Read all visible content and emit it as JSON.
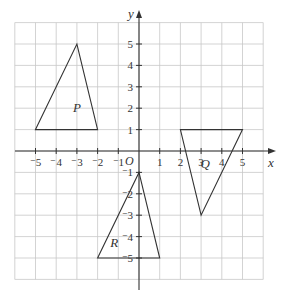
{
  "diagram": {
    "axes": {
      "x_label": "x",
      "y_label": "y",
      "origin_label": "O",
      "x_range": [
        -6,
        6
      ],
      "y_range": [
        -6,
        6
      ],
      "x_ticks": [
        "-5",
        "-4",
        "-3",
        "-2",
        "-1",
        "1",
        "2",
        "3",
        "4",
        "5"
      ],
      "y_ticks": [
        "5",
        "4",
        "3",
        "2",
        "1",
        "-1",
        "-2",
        "-3",
        "-4",
        "-5"
      ]
    },
    "shapes": [
      {
        "label": "P",
        "vertices": [
          [
            -5,
            1
          ],
          [
            -3,
            5
          ],
          [
            -2,
            1
          ]
        ]
      },
      {
        "label": "Q",
        "vertices": [
          [
            2,
            1
          ],
          [
            5,
            1
          ],
          [
            3,
            -3
          ]
        ]
      },
      {
        "label": "R",
        "vertices": [
          [
            0,
            -1
          ],
          [
            1,
            -5
          ],
          [
            -2,
            -5
          ]
        ]
      }
    ]
  }
}
